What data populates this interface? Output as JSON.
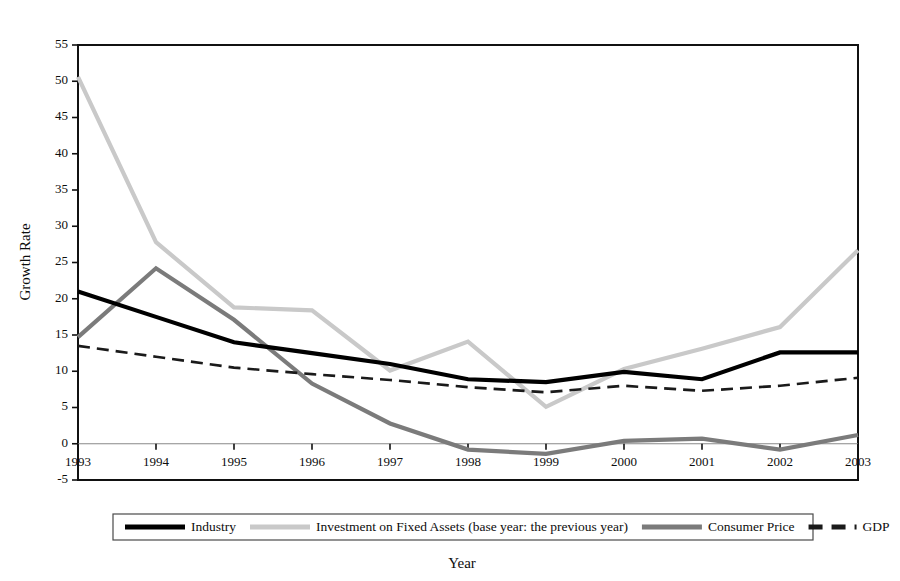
{
  "chart_data": {
    "type": "line",
    "title": "",
    "xlabel": "Year",
    "ylabel": "Growth Rate",
    "categories": [
      "1993",
      "1994",
      "1995",
      "1996",
      "1997",
      "1998",
      "1999",
      "2000",
      "2001",
      "2002",
      "2003"
    ],
    "x": [
      1993,
      1994,
      1995,
      1996,
      1997,
      1998,
      1999,
      2000,
      2001,
      2002,
      2003
    ],
    "xlim": [
      1993,
      2003
    ],
    "ylim": [
      -5,
      55
    ],
    "ytick_labels": [
      "-5",
      "0",
      "5",
      "10",
      "15",
      "20",
      "25",
      "30",
      "35",
      "40",
      "45",
      "50",
      "55"
    ],
    "yticks": [
      -5,
      0,
      5,
      10,
      15,
      20,
      25,
      30,
      35,
      40,
      45,
      50,
      55
    ],
    "grid": false,
    "legend_position": "bottom",
    "series": [
      {
        "name": "Industry",
        "color": "#000000",
        "width": 4.2,
        "dash": "none",
        "values": [
          21.0,
          17.5,
          14.0,
          12.5,
          11.0,
          8.9,
          8.5,
          9.9,
          8.9,
          12.6,
          12.6
        ]
      },
      {
        "name": "Investment on Fixed Assets (base year: the previous year)",
        "color": "#c9c9c9",
        "width": 4.2,
        "dash": "none",
        "values": [
          50.6,
          27.8,
          18.8,
          18.4,
          10.1,
          14.1,
          5.1,
          10.3,
          13.1,
          16.1,
          26.7
        ]
      },
      {
        "name": "Consumer Price",
        "color": "#7b7b7b",
        "width": 4.2,
        "dash": "none",
        "values": [
          14.7,
          24.2,
          17.1,
          8.3,
          2.8,
          -0.8,
          -1.4,
          0.4,
          0.7,
          -0.8,
          1.2
        ]
      },
      {
        "name": "GDP",
        "color": "#1a1a1a",
        "width": 2.6,
        "dash": "12,7",
        "values": [
          13.5,
          12.0,
          10.5,
          9.6,
          8.8,
          7.8,
          7.1,
          8.0,
          7.3,
          8.0,
          9.1
        ]
      }
    ]
  },
  "axis": {
    "y_title": "Growth Rate",
    "x_title": "Year"
  },
  "legend": {
    "items": [
      {
        "label": "Industry"
      },
      {
        "label": "Investment on Fixed Assets (base year: the previous year)"
      },
      {
        "label": "Consumer Price"
      },
      {
        "label": "GDP"
      }
    ]
  }
}
